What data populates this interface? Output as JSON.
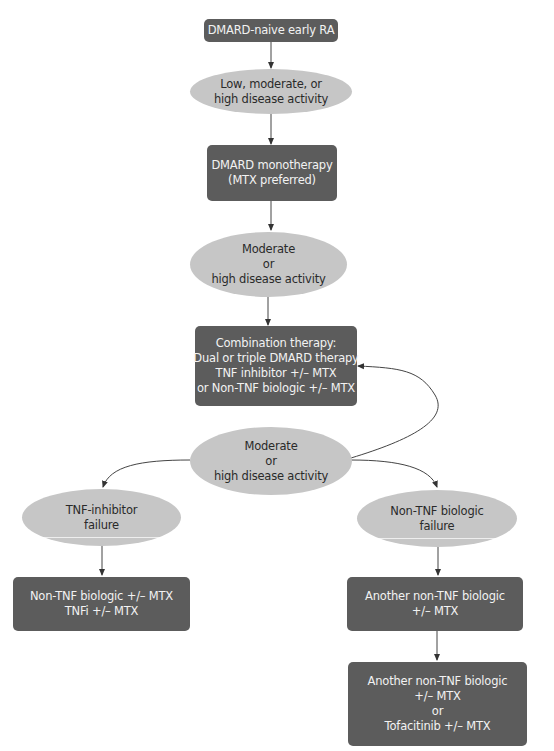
{
  "diagram": {
    "type": "flowchart",
    "colors": {
      "box_fill": "#5c5c5c",
      "box_text": "#f2f2f2",
      "ellipse_fill": "#c6c6c6",
      "ellipse_text": "#2a2a2a",
      "edge": "#333333"
    },
    "nodes": {
      "start": {
        "lines": [
          "DMARD-naive early RA"
        ]
      },
      "activity_1": {
        "lines": [
          "Low, moderate, or",
          "high disease activity"
        ]
      },
      "monotherapy": {
        "lines": [
          "DMARD monotherapy",
          "(MTX preferred)"
        ]
      },
      "activity_2": {
        "lines": [
          "Moderate",
          "or",
          "high disease activity"
        ]
      },
      "combination": {
        "lines": [
          "Combination therapy:",
          "Dual or triple DMARD therapy",
          "TNF inhibitor +/– MTX",
          "or Non-TNF biologic +/– MTX"
        ]
      },
      "activity_3": {
        "lines": [
          "Moderate",
          "or",
          "high disease activity"
        ]
      },
      "tnf_failure": {
        "lines": [
          "TNF-inhibitor",
          "failure"
        ]
      },
      "non_tnf_failure": {
        "lines": [
          "Non-TNF biologic",
          "failure"
        ]
      },
      "tnf_failure_treatment": {
        "lines": [
          "Non-TNF biologic +/– MTX",
          "TNFi +/– MTX"
        ]
      },
      "non_tnf_treatment_1": {
        "lines": [
          "Another non-TNF biologic",
          "+/– MTX"
        ]
      },
      "non_tnf_treatment_2": {
        "lines": [
          "Another non-TNF biologic",
          "+/– MTX",
          "or",
          "Tofacitinib +/– MTX"
        ]
      }
    },
    "edges": [
      {
        "from": "start",
        "to": "activity_1"
      },
      {
        "from": "activity_1",
        "to": "monotherapy"
      },
      {
        "from": "monotherapy",
        "to": "activity_2"
      },
      {
        "from": "activity_2",
        "to": "combination"
      },
      {
        "from": "activity_3",
        "to": "combination",
        "style": "curved-loop"
      },
      {
        "from": "activity_3",
        "to": "tnf_failure",
        "style": "curved"
      },
      {
        "from": "activity_3",
        "to": "non_tnf_failure",
        "style": "curved"
      },
      {
        "from": "tnf_failure",
        "to": "tnf_failure_treatment"
      },
      {
        "from": "non_tnf_failure",
        "to": "non_tnf_treatment_1"
      },
      {
        "from": "non_tnf_treatment_1",
        "to": "non_tnf_treatment_2"
      }
    ]
  }
}
